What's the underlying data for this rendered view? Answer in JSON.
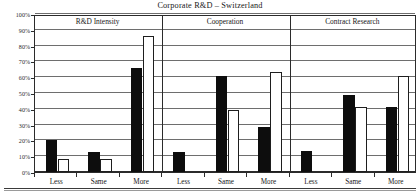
{
  "chart_data": {
    "type": "bar",
    "title": "Corporate R&D – Switzerland",
    "xlabel": "",
    "ylabel": "",
    "ylim": [
      0,
      100
    ],
    "ytick_labels": [
      "0%",
      "10%",
      "20%",
      "30%",
      "40%",
      "50%",
      "60%",
      "70%",
      "80%",
      "90%",
      "100%"
    ],
    "ytick_values": [
      0,
      10,
      20,
      30,
      40,
      50,
      60,
      70,
      80,
      90,
      100
    ],
    "grid": true,
    "legend_position": "none",
    "group_labels": [
      "R&D Intensity",
      "Cooperation",
      "Contract Research"
    ],
    "categories": [
      "Less",
      "Same",
      "More",
      "Less",
      "Same",
      "More",
      "Less",
      "Same",
      "More"
    ],
    "series": [
      {
        "name": "series-dark",
        "color": "#0d0d0d",
        "values": [
          20,
          12.5,
          66,
          12.5,
          61,
          28.5,
          13,
          48.5,
          41
        ]
      },
      {
        "name": "series-light",
        "color": "#ffffff",
        "values": [
          8,
          8,
          86,
          0,
          39,
          63,
          0,
          41,
          61
        ]
      }
    ],
    "groups": [
      {
        "label": "R&D Intensity",
        "categories": [
          "Less",
          "Same",
          "More"
        ],
        "dark": [
          20,
          12.5,
          66
        ],
        "light": [
          8,
          8,
          86
        ]
      },
      {
        "label": "Cooperation",
        "categories": [
          "Less",
          "Same",
          "More"
        ],
        "dark": [
          12.5,
          61,
          28.5
        ],
        "light": [
          0,
          39,
          63
        ]
      },
      {
        "label": "Contract Research",
        "categories": [
          "Less",
          "Same",
          "More"
        ],
        "dark": [
          13,
          48.5,
          41
        ],
        "light": [
          0,
          41,
          61
        ]
      }
    ]
  },
  "figure": {
    "title": "Corporate R&D – Switzerland"
  }
}
